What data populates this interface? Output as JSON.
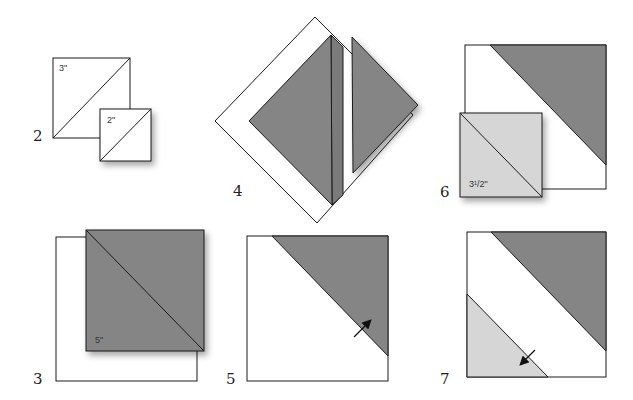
{
  "figure": {
    "type": "quilting-instruction-diagram",
    "colors": {
      "dark_fabric": "#858585",
      "light_fabric": "#d6d6d6",
      "background_fabric": "#ffffff",
      "outline": "#1a1a1a"
    },
    "steps": [
      {
        "number": "2",
        "labels": [
          "3\"",
          "2\""
        ]
      },
      {
        "number": "3",
        "labels": [
          "5\""
        ]
      },
      {
        "number": "4",
        "labels": []
      },
      {
        "number": "5",
        "labels": []
      },
      {
        "number": "6",
        "labels": [
          "3¹/2\""
        ]
      },
      {
        "number": "7",
        "labels": []
      }
    ]
  }
}
